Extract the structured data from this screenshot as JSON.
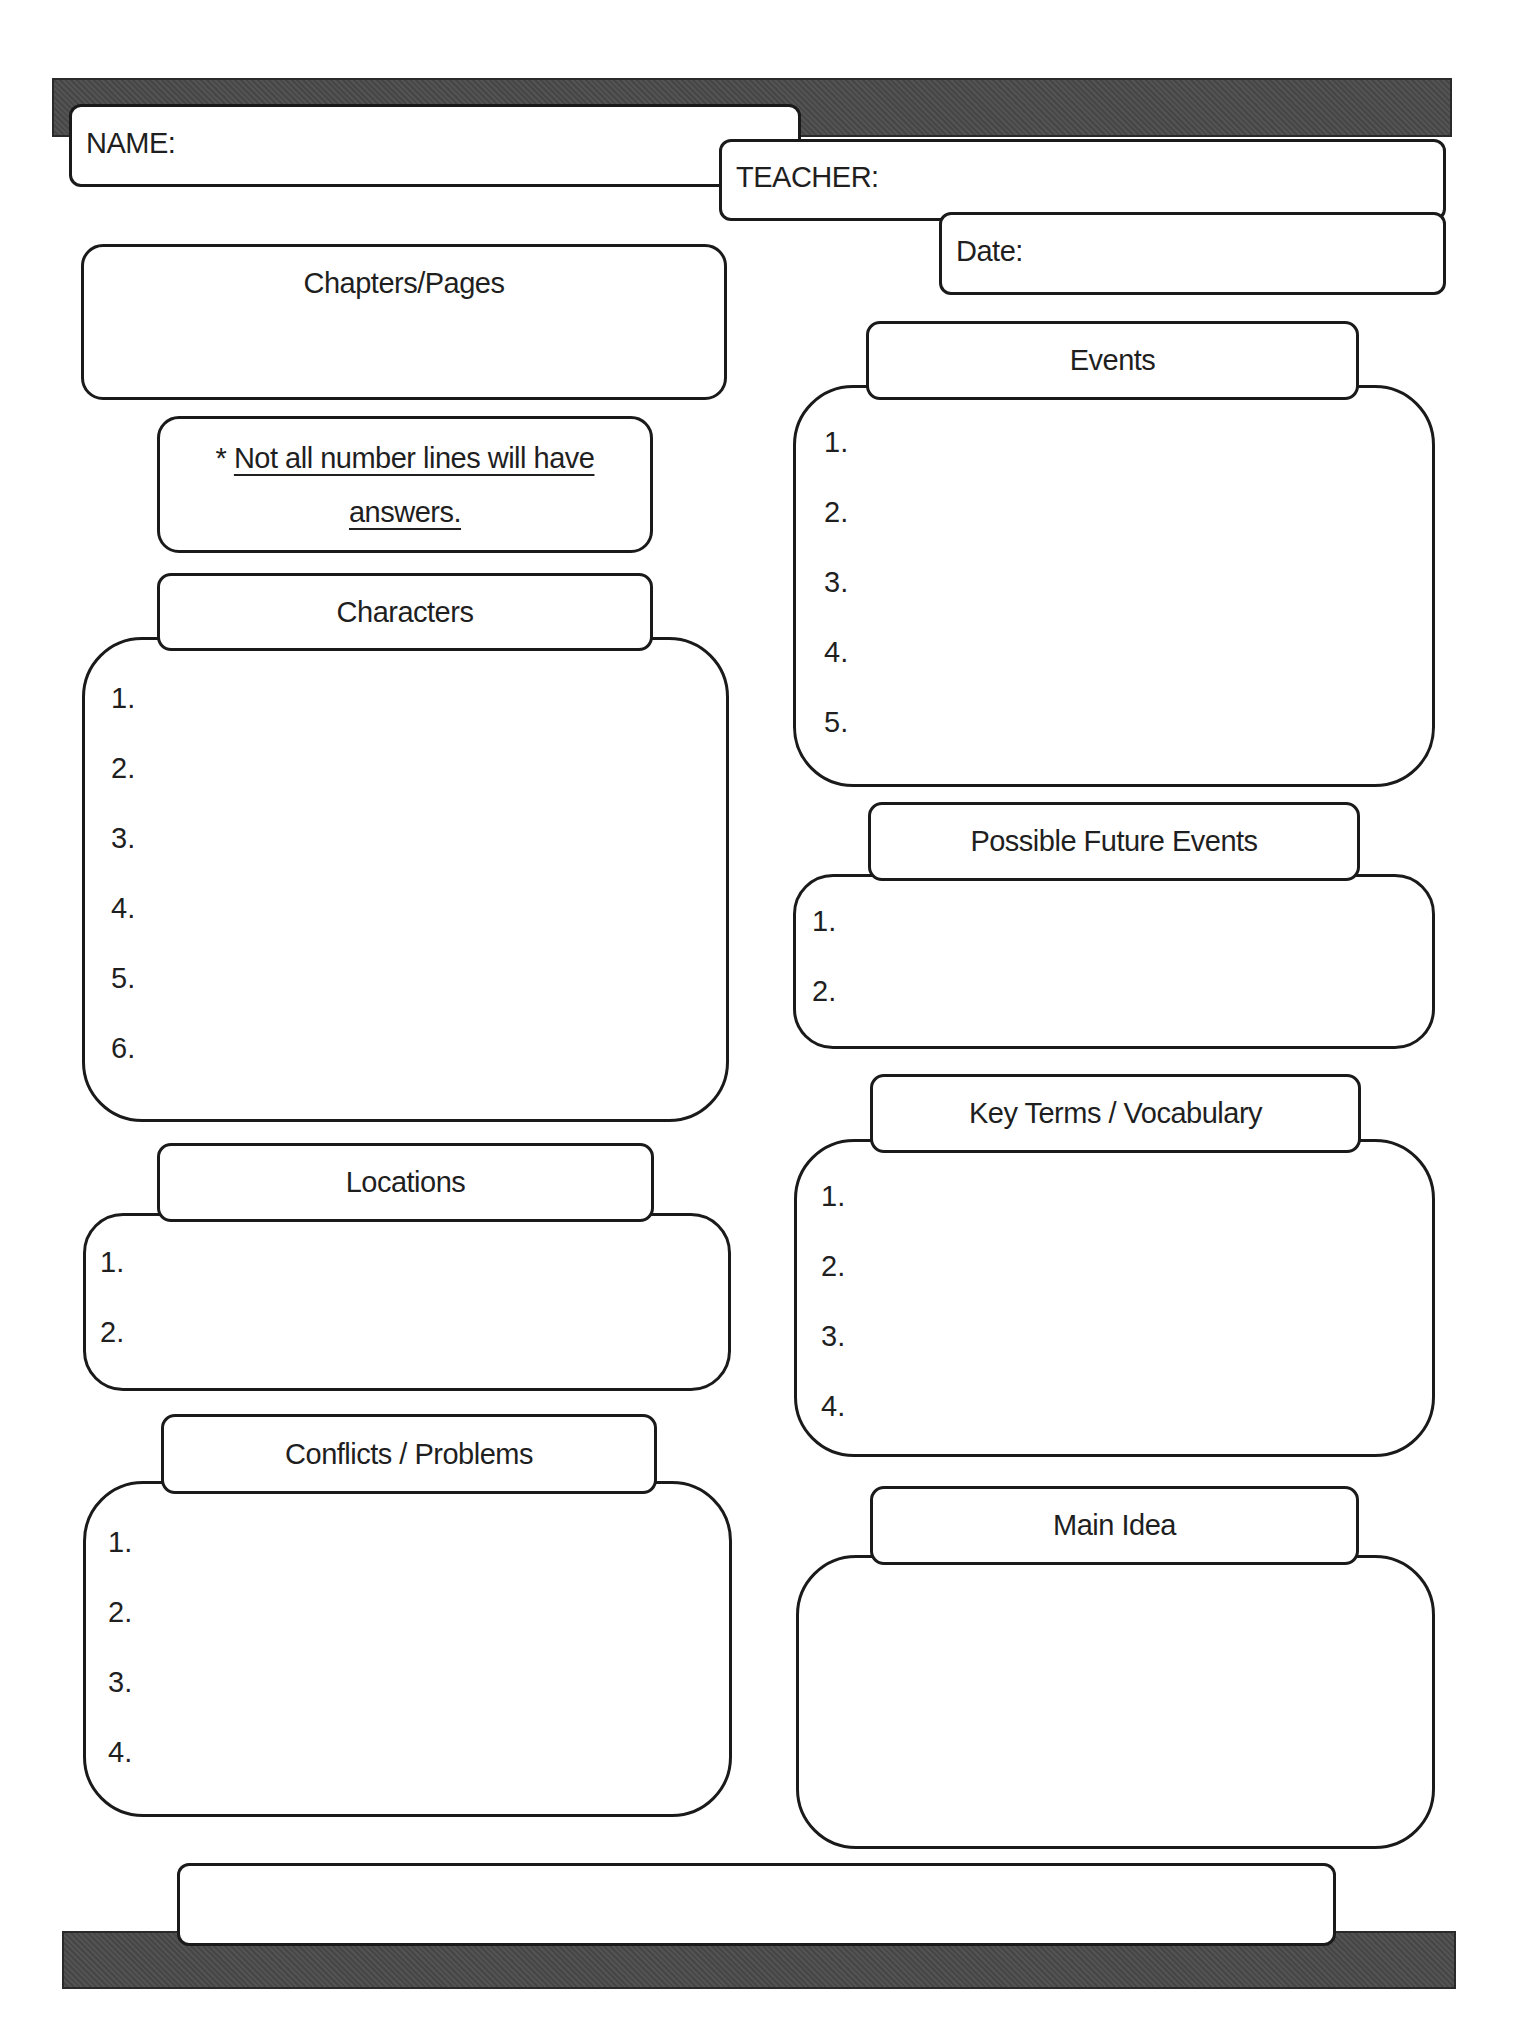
{
  "header": {
    "name_label": "NAME:",
    "teacher_label": "TEACHER:",
    "date_label": "Date:"
  },
  "chapters": {
    "title": "Chapters/Pages"
  },
  "note": {
    "asterisk": "*",
    "line1": "Not all number lines will have",
    "line2": "answers."
  },
  "sections": {
    "characters": {
      "title": "Characters",
      "items": [
        "1.",
        "2.",
        "3.",
        "4.",
        "5.",
        "6."
      ]
    },
    "locations": {
      "title": "Locations",
      "items": [
        "1.",
        "2."
      ]
    },
    "conflicts": {
      "title": "Conflicts / Problems",
      "items": [
        "1.",
        "2.",
        "3.",
        "4."
      ]
    },
    "events": {
      "title": "Events",
      "items": [
        "1.",
        "2.",
        "3.",
        "4.",
        "5."
      ]
    },
    "future_events": {
      "title": "Possible Future Events",
      "items": [
        "1.",
        "2."
      ]
    },
    "key_terms": {
      "title": "Key Terms / Vocabulary",
      "items": [
        "1.",
        "2.",
        "3.",
        "4."
      ]
    },
    "main_idea": {
      "title": "Main Idea"
    }
  },
  "footer": {
    "text": ""
  },
  "colors": {
    "bar": "#4a4a4a",
    "border": "#1a1a1a",
    "background": "#ffffff"
  }
}
